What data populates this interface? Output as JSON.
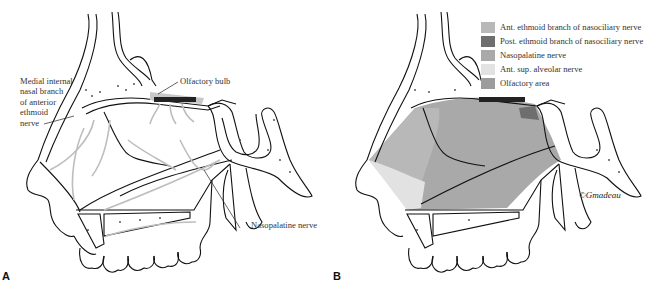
{
  "figure": {
    "panel_a": {
      "letter": "A",
      "labels": {
        "medial_internal": [
          "Medial internal",
          "nasal branch",
          "of anterior",
          "ethmoid",
          "nerve"
        ],
        "olfactory_bulb": "Olfactory bulb",
        "nasopalatine": "Nasopalatine nerve"
      }
    },
    "panel_b": {
      "letter": "B",
      "legend": [
        {
          "label": "Ant. ethmoid branch of nasociliary nerve",
          "color": "#b8b8b8"
        },
        {
          "label": "Post. ethmoid branch of nasociliary nerve",
          "color": "#6e6e6e"
        },
        {
          "label": "Nasopalatine nerve",
          "color": "#a9a9a9"
        },
        {
          "label": "Ant. sup. alveolar nerve",
          "color": "#e2e2e2"
        },
        {
          "label": "Olfactory area",
          "color": "#9c9c9c"
        }
      ],
      "signature": "©Gmadeau"
    }
  }
}
